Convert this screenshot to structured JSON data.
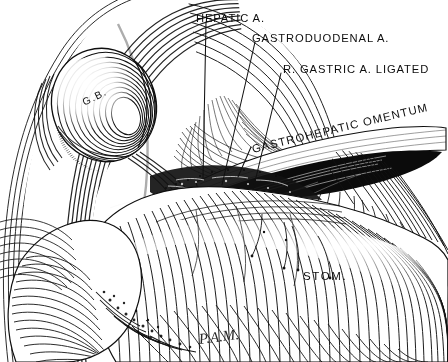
{
  "plate": {
    "kind": "anatomical-line-engraving",
    "subject": "Upper abdominal dissection showing gallbladder, stomach and gastrohepatic omentum",
    "background_color": "#ffffff",
    "ink_color": "#111111",
    "width": 448,
    "height": 362
  },
  "labels": {
    "hepatic_artery": "HEPATIC A.",
    "gastroduodenal_artery": "GASTRODUODENAL A.",
    "right_gastric_ligated": "R. GASTRIC A. LIGATED",
    "gastrohepatic_omentum": "GASTROHEPATIC OMENTUM",
    "gallbladder": "G.B.",
    "stomach": "STOM."
  },
  "signature": {
    "text": "P.A.M.",
    "style": "cursive-monogram"
  },
  "leader_lines": [
    {
      "name": "hepatic-artery-leader",
      "from": [
        206,
        22
      ],
      "to": [
        203,
        178
      ]
    },
    {
      "name": "gastroduodenal-artery-leader",
      "from": [
        255,
        42
      ],
      "to": [
        222,
        185
      ]
    },
    {
      "name": "right-gastric-artery-leader",
      "from": [
        281,
        73
      ],
      "to": [
        253,
        190
      ]
    },
    {
      "name": "gastrohepatic-omentum-leader",
      "from": [
        250,
        148
      ],
      "to": [
        238,
        176
      ]
    }
  ]
}
